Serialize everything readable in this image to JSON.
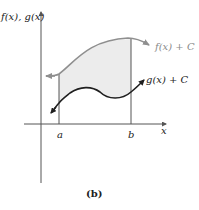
{
  "figure": {
    "caption": "(b)",
    "y_axis_label": "f(x), g(x)",
    "x_axis_label": "x",
    "ticks": {
      "a": "a",
      "b": "b"
    },
    "curves": [
      {
        "name": "f",
        "label": "f(x) + C",
        "color": "#8f8f8f"
      },
      {
        "name": "g",
        "label": "g(x) + C",
        "color": "#1f1f1f"
      }
    ],
    "shaded_region": {
      "between": [
        "f(x) + C",
        "g(x) + C"
      ],
      "from": "a",
      "to": "b",
      "color": "#ececec"
    }
  }
}
